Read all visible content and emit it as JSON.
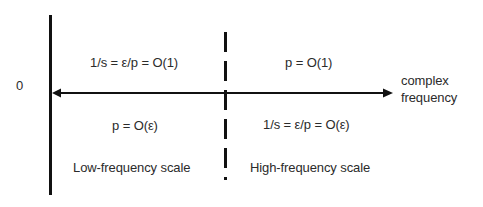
{
  "diagram": {
    "axis": {
      "origin_label": "0",
      "axis_label_line1": "complex",
      "axis_label_line2": "frequency"
    },
    "regions": {
      "low": {
        "upper_label": "1/s = ε/p = O(1)",
        "lower_label": "p = O(ε)",
        "scale_label": "Low-frequency scale"
      },
      "high": {
        "upper_label": "p = O(1)",
        "lower_label": "1/s = ε/p = O(ε)",
        "scale_label": "High-frequency scale"
      }
    },
    "colors": {
      "line": "#111111",
      "text": "#2b2b2b",
      "background": "#ffffff"
    }
  }
}
